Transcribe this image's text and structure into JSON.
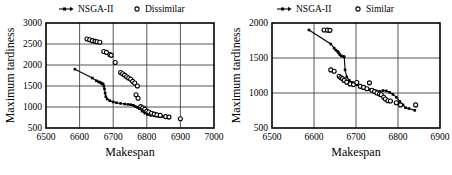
{
  "figure": {
    "panel_count": 2,
    "background_color": "#ffffff",
    "ink_color": "#000000"
  },
  "chart_data": [
    {
      "type": "scatter",
      "panel": "left",
      "title": "",
      "xlabel": "Makespan",
      "ylabel": "Maximum tardiness",
      "xlim": [
        6500,
        7000
      ],
      "ylim": [
        500,
        3000
      ],
      "xticks": [
        6500,
        6600,
        6700,
        6800,
        6900,
        7000
      ],
      "yticks": [
        500,
        1000,
        1500,
        2000,
        2500,
        3000
      ],
      "grid": true,
      "legend_position": "above-plot",
      "series": [
        {
          "name": "NSGA-II",
          "marker": "filled-square",
          "line": true,
          "points": [
            [
              6586,
              1900
            ],
            [
              6638,
              1690
            ],
            [
              6650,
              1625
            ],
            [
              6656,
              1600
            ],
            [
              6660,
              1590
            ],
            [
              6663,
              1575
            ],
            [
              6666,
              1560
            ],
            [
              6668,
              1552
            ],
            [
              6670,
              1545
            ],
            [
              6672,
              1500
            ],
            [
              6674,
              1430
            ],
            [
              6676,
              1330
            ],
            [
              6678,
              1245
            ],
            [
              6682,
              1190
            ],
            [
              6690,
              1150
            ],
            [
              6700,
              1120
            ],
            [
              6710,
              1100
            ],
            [
              6722,
              1085
            ],
            [
              6734,
              1070
            ],
            [
              6744,
              1062
            ],
            [
              6752,
              1055
            ],
            [
              6760,
              1040
            ],
            [
              6766,
              1010
            ],
            [
              6772,
              990
            ],
            [
              6778,
              960
            ],
            [
              6786,
              900
            ],
            [
              6794,
              855
            ],
            [
              6802,
              820
            ],
            [
              6812,
              800
            ],
            [
              6822,
              790
            ],
            [
              6834,
              782
            ],
            [
              6846,
              775
            ],
            [
              6858,
              762
            ],
            [
              6868,
              752
            ]
          ]
        },
        {
          "name": "Dissimilar",
          "marker": "open-circle",
          "line": false,
          "points": [
            [
              6622,
              2620
            ],
            [
              6630,
              2600
            ],
            [
              6638,
              2580
            ],
            [
              6646,
              2562
            ],
            [
              6652,
              2552
            ],
            [
              6660,
              2542
            ],
            [
              6672,
              2320
            ],
            [
              6680,
              2300
            ],
            [
              6690,
              2250
            ],
            [
              6694,
              2230
            ],
            [
              6706,
              2060
            ],
            [
              6722,
              1820
            ],
            [
              6728,
              1790
            ],
            [
              6734,
              1760
            ],
            [
              6740,
              1720
            ],
            [
              6746,
              1690
            ],
            [
              6752,
              1660
            ],
            [
              6758,
              1610
            ],
            [
              6764,
              1570
            ],
            [
              6772,
              1500
            ],
            [
              6768,
              1290
            ],
            [
              6774,
              1210
            ],
            [
              6782,
              1010
            ],
            [
              6788,
              980
            ],
            [
              6794,
              950
            ],
            [
              6800,
              900
            ],
            [
              6806,
              880
            ],
            [
              6814,
              850
            ],
            [
              6822,
              830
            ],
            [
              6830,
              812
            ],
            [
              6840,
              800
            ],
            [
              6856,
              772
            ],
            [
              6866,
              760
            ],
            [
              6900,
              720
            ]
          ]
        }
      ]
    },
    {
      "type": "scatter",
      "panel": "right",
      "title": "",
      "xlabel": "Makespan",
      "ylabel": "Maximum tardiness",
      "xlim": [
        6500,
        6900
      ],
      "ylim": [
        500,
        2000
      ],
      "xticks": [
        6500,
        6600,
        6700,
        6800,
        6900
      ],
      "yticks": [
        500,
        1000,
        1500,
        2000
      ],
      "grid": true,
      "legend_position": "above-plot",
      "series": [
        {
          "name": "NSGA-II",
          "marker": "filled-square",
          "line": true,
          "points": [
            [
              6588,
              1900
            ],
            [
              6640,
              1700
            ],
            [
              6648,
              1640
            ],
            [
              6652,
              1612
            ],
            [
              6656,
              1595
            ],
            [
              6658,
              1578
            ],
            [
              6660,
              1560
            ],
            [
              6662,
              1545
            ],
            [
              6665,
              1530
            ],
            [
              6670,
              1520
            ],
            [
              6672,
              1518
            ],
            [
              6674,
              1330
            ],
            [
              6678,
              1230
            ],
            [
              6684,
              1180
            ],
            [
              6692,
              1150
            ],
            [
              6700,
              1120
            ],
            [
              6708,
              1095
            ],
            [
              6716,
              1075
            ],
            [
              6724,
              1060
            ],
            [
              6732,
              1048
            ],
            [
              6740,
              1040
            ],
            [
              6748,
              1030
            ],
            [
              6756,
              1022
            ],
            [
              6764,
              1035
            ],
            [
              6772,
              1030
            ],
            [
              6780,
              1010
            ],
            [
              6788,
              980
            ],
            [
              6796,
              940
            ],
            [
              6804,
              880
            ],
            [
              6812,
              830
            ],
            [
              6818,
              790
            ],
            [
              6826,
              778
            ],
            [
              6840,
              752
            ]
          ]
        },
        {
          "name": "Similar",
          "marker": "open-circle",
          "line": false,
          "points": [
            [
              6624,
              1900
            ],
            [
              6632,
              1898
            ],
            [
              6638,
              1895
            ],
            [
              6640,
              1330
            ],
            [
              6648,
              1310
            ],
            [
              6660,
              1240
            ],
            [
              6664,
              1220
            ],
            [
              6668,
              1205
            ],
            [
              6672,
              1180
            ],
            [
              6678,
              1155
            ],
            [
              6686,
              1130
            ],
            [
              6694,
              1120
            ],
            [
              6702,
              1150
            ],
            [
              6710,
              1095
            ],
            [
              6718,
              1080
            ],
            [
              6726,
              1060
            ],
            [
              6732,
              1145
            ],
            [
              6738,
              1040
            ],
            [
              6744,
              1020
            ],
            [
              6750,
              1000
            ],
            [
              6756,
              985
            ],
            [
              6760,
              975
            ],
            [
              6766,
              940
            ],
            [
              6770,
              915
            ],
            [
              6776,
              890
            ],
            [
              6782,
              885
            ],
            [
              6796,
              860
            ],
            [
              6806,
              830
            ],
            [
              6842,
              830
            ]
          ]
        }
      ]
    }
  ]
}
